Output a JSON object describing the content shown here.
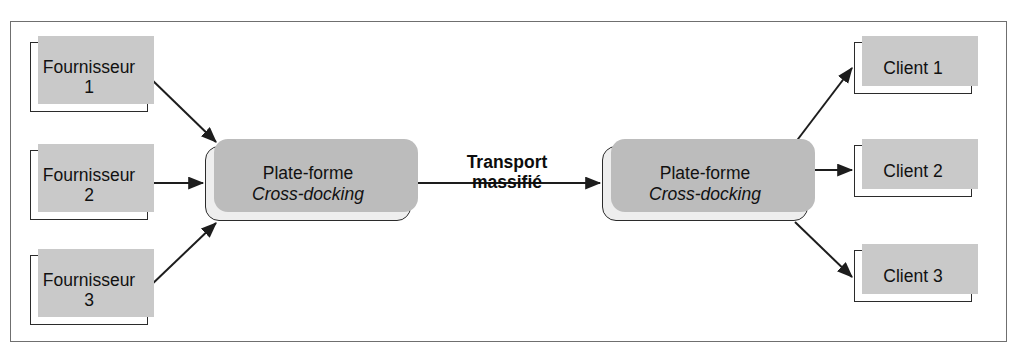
{
  "page": {
    "top_cut_text": "",
    "width": 1022,
    "height": 358
  },
  "colors": {
    "frame_border": "#6f6f6f",
    "node_border": "#2b2b2b",
    "node_fill": "#ffffff",
    "platform_fill": "#eeeeee",
    "shadow": "#c9c9c9",
    "arrow": "#1d1d1d",
    "text": "#111111"
  },
  "diagram": {
    "title": "",
    "suppliers": [
      {
        "line1": "Fournisseur",
        "line2": "1"
      },
      {
        "line1": "Fournisseur",
        "line2": "2"
      },
      {
        "line1": "Fournisseur",
        "line2": "3"
      }
    ],
    "platforms": [
      {
        "line1": "Plate-forme",
        "line2": "Cross-docking"
      },
      {
        "line1": "Plate-forme",
        "line2": "Cross-docking"
      }
    ],
    "transport": {
      "line1": "Transport",
      "line2": "massifié"
    },
    "clients": [
      {
        "label": "Client 1"
      },
      {
        "label": "Client 2"
      },
      {
        "label": "Client 3"
      }
    ]
  }
}
